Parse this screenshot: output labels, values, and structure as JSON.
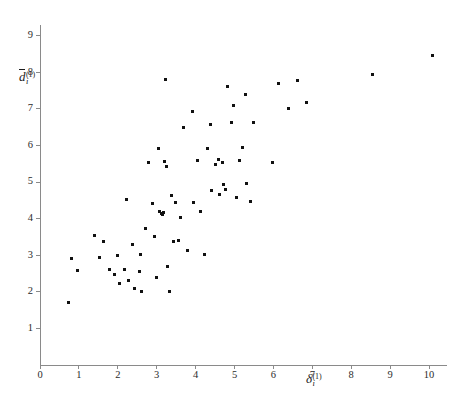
{
  "chart_data": {
    "type": "scatter",
    "title": "",
    "xlabel": "delta_i^(1)",
    "ylabel": "d-bar_i^(1)",
    "xlim": [
      0,
      10.45
    ],
    "ylim": [
      0,
      9.3
    ],
    "grid": false,
    "legend": null,
    "xticks": [
      0,
      1,
      2,
      3,
      4,
      5,
      6,
      7,
      8,
      9,
      10
    ],
    "xtick_labels": [
      "0",
      "1",
      "2",
      "3",
      "4",
      "5",
      "6",
      "7",
      "8",
      "9",
      "10"
    ],
    "yticks": [
      1,
      2,
      3,
      4,
      5,
      6,
      7,
      8,
      9
    ],
    "ytick_labels": [
      "1",
      "2",
      "3",
      "4",
      "5",
      "6",
      "7",
      "8",
      "9"
    ],
    "marker": "square",
    "marker_color": "#111111",
    "marker_size_px": 3,
    "n_points": 71,
    "points": [
      [
        0.72,
        1.72
      ],
      [
        0.8,
        2.92
      ],
      [
        0.97,
        2.58
      ],
      [
        1.4,
        3.55
      ],
      [
        1.52,
        2.93
      ],
      [
        1.62,
        3.38
      ],
      [
        1.78,
        2.6
      ],
      [
        1.92,
        2.47
      ],
      [
        2.0,
        3.0
      ],
      [
        2.05,
        2.22
      ],
      [
        2.18,
        2.62
      ],
      [
        2.22,
        4.52
      ],
      [
        2.28,
        2.3
      ],
      [
        2.38,
        3.28
      ],
      [
        2.42,
        2.08
      ],
      [
        2.55,
        2.55
      ],
      [
        2.58,
        3.02
      ],
      [
        2.62,
        2.0
      ],
      [
        2.72,
        3.72
      ],
      [
        2.8,
        5.52
      ],
      [
        2.88,
        4.42
      ],
      [
        2.95,
        3.5
      ],
      [
        3.0,
        2.4
      ],
      [
        3.05,
        5.92
      ],
      [
        3.08,
        4.2
      ],
      [
        3.12,
        4.15
      ],
      [
        3.15,
        4.12
      ],
      [
        3.18,
        4.18
      ],
      [
        3.2,
        5.55
      ],
      [
        3.22,
        7.8
      ],
      [
        3.25,
        5.42
      ],
      [
        3.28,
        2.7
      ],
      [
        3.32,
        2.0
      ],
      [
        3.38,
        4.62
      ],
      [
        3.42,
        3.38
      ],
      [
        3.48,
        4.45
      ],
      [
        3.55,
        3.4
      ],
      [
        3.62,
        4.02
      ],
      [
        3.7,
        6.5
      ],
      [
        3.78,
        3.12
      ],
      [
        3.92,
        6.92
      ],
      [
        3.95,
        4.45
      ],
      [
        4.05,
        5.58
      ],
      [
        4.12,
        4.2
      ],
      [
        4.22,
        3.02
      ],
      [
        4.3,
        5.92
      ],
      [
        4.38,
        6.58
      ],
      [
        4.42,
        4.78
      ],
      [
        4.5,
        5.48
      ],
      [
        4.58,
        5.62
      ],
      [
        4.62,
        4.65
      ],
      [
        4.68,
        5.52
      ],
      [
        4.72,
        4.92
      ],
      [
        4.78,
        4.8
      ],
      [
        4.82,
        7.62
      ],
      [
        4.92,
        6.62
      ],
      [
        4.98,
        7.08
      ],
      [
        5.05,
        4.58
      ],
      [
        5.12,
        5.6
      ],
      [
        5.2,
        5.95
      ],
      [
        5.28,
        7.4
      ],
      [
        5.32,
        4.95
      ],
      [
        5.42,
        4.48
      ],
      [
        5.48,
        6.62
      ],
      [
        5.98,
        5.52
      ],
      [
        6.12,
        7.68
      ],
      [
        6.4,
        7.0
      ],
      [
        6.62,
        7.78
      ],
      [
        6.85,
        7.18
      ],
      [
        8.55,
        7.95
      ],
      [
        10.1,
        8.45
      ]
    ]
  },
  "axis_titles": {
    "y": {
      "letter": "d",
      "subscript": "i",
      "superscript": "(1)"
    },
    "x": {
      "letter": "δ",
      "subscript": "i",
      "superscript": "(1)"
    }
  }
}
